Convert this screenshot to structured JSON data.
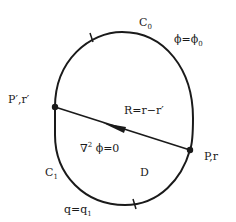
{
  "figure": {
    "colors": {
      "stroke": "#1a1a1a",
      "background": "#ffffff"
    },
    "boundary_upper": {
      "label": "C",
      "subscript": "0",
      "condition": "ϕ=ϕ",
      "condition_subscript": "0"
    },
    "boundary_lower": {
      "label": "C",
      "subscript": "1",
      "condition": "q=q",
      "condition_subscript": "1"
    },
    "point_source": {
      "label": "P′,r′"
    },
    "point_field": {
      "label": "P,r"
    },
    "vector": {
      "label": "R=r−r′"
    },
    "equation": {
      "label": "∇",
      "superscript": "2",
      "rest": " ϕ=0"
    },
    "domain": {
      "label": "D"
    }
  }
}
